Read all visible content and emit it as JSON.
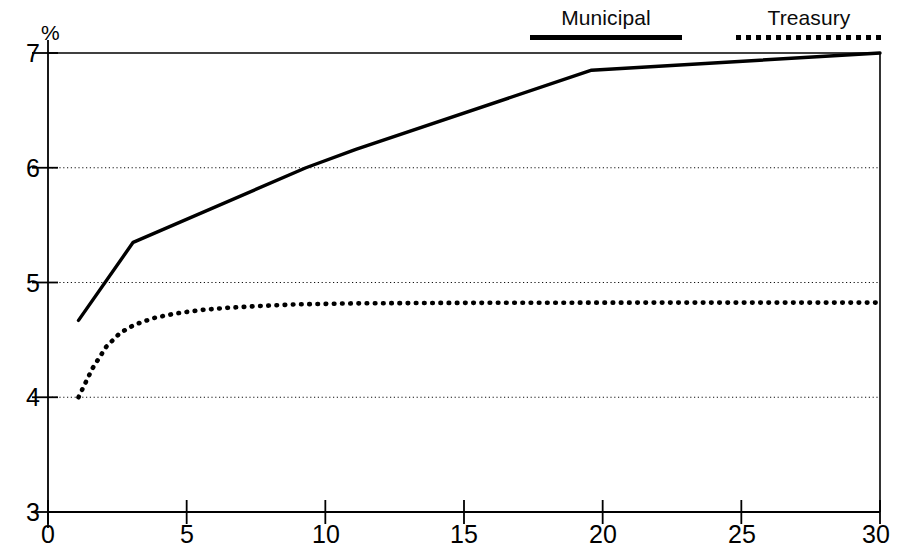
{
  "chart_data": {
    "type": "line",
    "title": "",
    "subtitle": "",
    "xlabel": "",
    "ylabel": "%",
    "unit_label": "%",
    "xlim": [
      0,
      30
    ],
    "ylim": [
      3,
      7
    ],
    "xticks": [
      0,
      5,
      10,
      15,
      20,
      25,
      30
    ],
    "xtick_labels": [
      "0",
      "5",
      "10",
      "15",
      "20",
      "25",
      "30"
    ],
    "yticks": [
      3,
      4,
      5,
      6,
      7
    ],
    "ytick_labels": [
      "3",
      "4",
      "5",
      "6",
      "7"
    ],
    "grid": "horizontal-dotted",
    "gridlines_y": [
      4,
      5,
      6
    ],
    "legend_position": "top-right",
    "series": [
      {
        "name": "Municipal",
        "style": "solid",
        "color": "#000000",
        "points": [
          [
            1.1,
            4.67
          ],
          [
            3.07,
            5.35
          ],
          [
            9.3,
            6.0
          ],
          [
            11.1,
            6.16
          ],
          [
            19.6,
            6.85
          ],
          [
            30.0,
            7.0
          ]
        ]
      },
      {
        "name": "Treasury",
        "style": "dotted",
        "color": "#000000",
        "points": [
          [
            1.1,
            4.0
          ],
          [
            1.6,
            4.25
          ],
          [
            2.1,
            4.44
          ],
          [
            2.6,
            4.56
          ],
          [
            3.1,
            4.63
          ],
          [
            3.8,
            4.69
          ],
          [
            4.6,
            4.73
          ],
          [
            5.5,
            4.76
          ],
          [
            6.5,
            4.78
          ],
          [
            7.6,
            4.795
          ],
          [
            9.0,
            4.81
          ],
          [
            11.0,
            4.818
          ],
          [
            14.0,
            4.822
          ],
          [
            18.0,
            4.824
          ],
          [
            23.0,
            4.825
          ],
          [
            30.0,
            4.825
          ]
        ]
      }
    ]
  },
  "legend": {
    "entries": [
      {
        "label": "Municipal",
        "style": "solid"
      },
      {
        "label": "Treasury",
        "style": "dotted"
      }
    ]
  },
  "axes": {
    "unit_label": "%",
    "y_labels": [
      "7",
      "6",
      "5",
      "4",
      "3"
    ],
    "x_labels": [
      "0",
      "5",
      "10",
      "15",
      "20",
      "25",
      "30"
    ]
  }
}
